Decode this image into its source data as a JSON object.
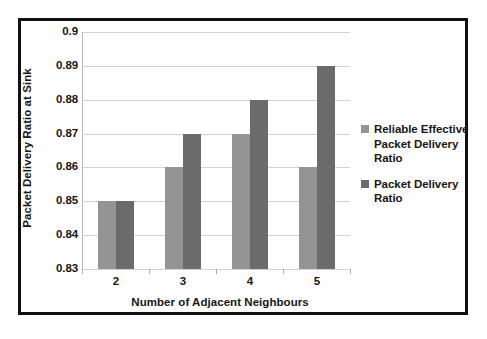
{
  "chart_data": {
    "type": "bar",
    "title": "",
    "subtitle": "",
    "xlabel": "Number of Adjacent Neighbours",
    "ylabel": "Packet Delivery Ratio at Sink",
    "categories": [
      "2",
      "3",
      "4",
      "5"
    ],
    "series": [
      {
        "name": "Reliable Effective Packet Delivery Ratio",
        "color": "#949494",
        "values": [
          0.85,
          0.86,
          0.87,
          0.86
        ]
      },
      {
        "name": "Packet Delivery Ratio",
        "color": "#6b6b6b",
        "values": [
          0.85,
          0.87,
          0.88,
          0.89
        ]
      }
    ],
    "ylim": [
      0.83,
      0.9
    ],
    "ytick_values": [
      0.83,
      0.84,
      0.85,
      0.86,
      0.87,
      0.88,
      0.89,
      0.9
    ],
    "ytick_labels": [
      "0.83",
      "0.84",
      "0.85",
      "0.86",
      "0.87",
      "0.88",
      "0.89",
      "0.9"
    ],
    "grid": "horizontal",
    "legend_position": "right",
    "legend": [
      {
        "label": "Reliable Effective Packet Delivery Ratio",
        "color": "#949494"
      },
      {
        "label": "Packet Delivery Ratio",
        "color": "#6b6b6b"
      }
    ]
  },
  "figure": {
    "border_color": "#111111",
    "background": "#ffffff",
    "gridline_color": "#d2d2d2",
    "axis_color": "#a8a8a8",
    "text_color": "#161616"
  }
}
